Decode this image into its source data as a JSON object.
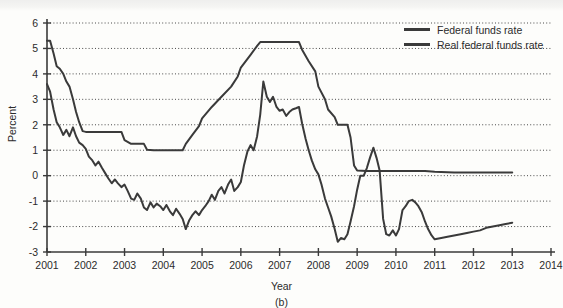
{
  "figure": {
    "panel_label": "(b)",
    "xlabel": "Year",
    "ylabel": "Percent"
  },
  "legend": {
    "position": "top-right",
    "items": [
      {
        "label": "Federal funds rate",
        "color": "#3a3a3a"
      },
      {
        "label": "Real federal funds rate",
        "color": "#3a3a3a"
      }
    ]
  },
  "chart_data": {
    "type": "line",
    "title": "",
    "subtitle": "",
    "panel": "(b)",
    "xlabel": "Year",
    "ylabel": "Percent",
    "xlim": [
      2001,
      2014
    ],
    "ylim": [
      -3,
      6
    ],
    "xticks": [
      2001,
      2002,
      2003,
      2004,
      2005,
      2006,
      2007,
      2008,
      2009,
      2010,
      2011,
      2012,
      2013,
      2014
    ],
    "yticks": [
      -3,
      -2,
      -1,
      0,
      1,
      2,
      3,
      4,
      5,
      6
    ],
    "xtick_labels": [
      "2001",
      "2002",
      "2003",
      "2004",
      "2005",
      "2006",
      "2007",
      "2008",
      "2009",
      "2010",
      "2011",
      "2012",
      "2013",
      "2014"
    ],
    "ytick_labels": [
      "-3",
      "-2",
      "-1",
      "0",
      "1",
      "2",
      "3",
      "4",
      "5",
      "6"
    ],
    "grid": "horizontal-dotted",
    "legend_position": "top-right",
    "series": [
      {
        "name": "Federal funds rate",
        "color": "#3a3a3a",
        "x": [
          2001.0,
          2001.08,
          2001.17,
          2001.25,
          2001.33,
          2001.42,
          2001.5,
          2001.58,
          2001.67,
          2001.75,
          2001.83,
          2001.92,
          2002.0,
          2002.25,
          2002.5,
          2002.75,
          2002.92,
          2003.0,
          2003.17,
          2003.5,
          2003.58,
          2003.75,
          2004.0,
          2004.25,
          2004.5,
          2004.58,
          2004.75,
          2004.92,
          2005.0,
          2005.25,
          2005.5,
          2005.75,
          2005.92,
          2006.0,
          2006.25,
          2006.42,
          2006.5,
          2006.75,
          2007.0,
          2007.25,
          2007.5,
          2007.58,
          2007.75,
          2007.92,
          2008.0,
          2008.17,
          2008.25,
          2008.42,
          2008.5,
          2008.75,
          2008.83,
          2008.92,
          2009.0,
          2009.25,
          2009.5,
          2009.75,
          2010.0,
          2010.25,
          2010.5,
          2010.75,
          2011.0,
          2011.5,
          2012.0,
          2012.5,
          2013.0
        ],
        "y": [
          5.3,
          5.3,
          4.8,
          4.3,
          4.2,
          4.0,
          3.7,
          3.5,
          3.0,
          2.5,
          2.1,
          1.75,
          1.72,
          1.72,
          1.72,
          1.72,
          1.72,
          1.4,
          1.25,
          1.25,
          1.02,
          1.0,
          1.0,
          1.0,
          1.0,
          1.25,
          1.6,
          1.95,
          2.25,
          2.7,
          3.1,
          3.5,
          3.9,
          4.25,
          4.75,
          5.1,
          5.25,
          5.25,
          5.25,
          5.25,
          5.25,
          4.95,
          4.5,
          4.1,
          3.5,
          3.0,
          2.6,
          2.3,
          2.0,
          2.0,
          1.5,
          0.4,
          0.2,
          0.18,
          0.18,
          0.18,
          0.18,
          0.18,
          0.18,
          0.18,
          0.15,
          0.12,
          0.12,
          0.12,
          0.12
        ],
        "notes": "Peaks at 5.25 from mid-2006 through 2007; falls to near zero by early 2009 and stays flat."
      },
      {
        "name": "Real federal funds rate",
        "color": "#3a3a3a",
        "x": [
          2001.0,
          2001.08,
          2001.17,
          2001.25,
          2001.33,
          2001.42,
          2001.5,
          2001.58,
          2001.67,
          2001.75,
          2001.83,
          2001.92,
          2002.0,
          2002.08,
          2002.17,
          2002.25,
          2002.33,
          2002.42,
          2002.5,
          2002.58,
          2002.67,
          2002.75,
          2002.83,
          2002.92,
          2003.0,
          2003.08,
          2003.17,
          2003.25,
          2003.33,
          2003.42,
          2003.5,
          2003.58,
          2003.67,
          2003.75,
          2003.83,
          2003.92,
          2004.0,
          2004.08,
          2004.17,
          2004.25,
          2004.33,
          2004.42,
          2004.5,
          2004.58,
          2004.67,
          2004.75,
          2004.83,
          2004.92,
          2005.0,
          2005.08,
          2005.17,
          2005.25,
          2005.33,
          2005.42,
          2005.5,
          2005.58,
          2005.67,
          2005.75,
          2005.83,
          2005.92,
          2006.0,
          2006.08,
          2006.17,
          2006.25,
          2006.33,
          2006.42,
          2006.5,
          2006.58,
          2006.67,
          2006.75,
          2006.83,
          2006.92,
          2007.0,
          2007.08,
          2007.17,
          2007.25,
          2007.33,
          2007.42,
          2007.5,
          2007.58,
          2007.67,
          2007.75,
          2007.83,
          2007.92,
          2008.0,
          2008.08,
          2008.17,
          2008.25,
          2008.33,
          2008.42,
          2008.5,
          2008.58,
          2008.67,
          2008.75,
          2008.83,
          2008.92,
          2009.0,
          2009.08,
          2009.17,
          2009.25,
          2009.33,
          2009.42,
          2009.5,
          2009.58,
          2009.67,
          2009.75,
          2009.83,
          2009.92,
          2010.0,
          2010.08,
          2010.17,
          2010.25,
          2010.33,
          2010.42,
          2010.5,
          2010.58,
          2010.67,
          2010.75,
          2010.83,
          2010.92,
          2011.0,
          2011.17,
          2011.33,
          2011.5,
          2011.67,
          2011.83,
          2012.0,
          2012.17,
          2012.33,
          2012.5,
          2012.67,
          2012.83,
          2013.0
        ],
        "y": [
          3.6,
          3.3,
          2.6,
          2.1,
          1.9,
          1.6,
          1.8,
          1.55,
          1.9,
          1.55,
          1.3,
          1.2,
          1.05,
          0.75,
          0.6,
          0.4,
          0.55,
          0.3,
          0.1,
          -0.1,
          -0.3,
          -0.15,
          -0.3,
          -0.45,
          -0.35,
          -0.6,
          -0.9,
          -0.95,
          -0.7,
          -0.9,
          -1.25,
          -1.35,
          -1.05,
          -1.25,
          -1.1,
          -1.2,
          -1.35,
          -1.15,
          -1.4,
          -1.55,
          -1.3,
          -1.5,
          -1.7,
          -2.1,
          -1.75,
          -1.55,
          -1.4,
          -1.55,
          -1.35,
          -1.2,
          -1.0,
          -0.75,
          -0.95,
          -0.6,
          -0.45,
          -0.7,
          -0.35,
          -0.15,
          -0.6,
          -0.45,
          -0.25,
          0.4,
          0.95,
          1.2,
          1.0,
          1.55,
          2.4,
          3.7,
          3.1,
          2.9,
          3.1,
          2.7,
          2.55,
          2.6,
          2.35,
          2.5,
          2.6,
          2.65,
          2.7,
          2.05,
          1.45,
          1.0,
          0.6,
          0.25,
          0.05,
          -0.35,
          -0.9,
          -1.25,
          -1.6,
          -2.1,
          -2.6,
          -2.45,
          -2.5,
          -2.3,
          -1.8,
          -1.2,
          -0.55,
          0.0,
          0.0,
          0.3,
          0.7,
          1.1,
          0.7,
          0.2,
          -1.7,
          -2.3,
          -2.35,
          -2.15,
          -2.35,
          -2.1,
          -1.35,
          -1.2,
          -1.0,
          -0.95,
          -1.05,
          -1.2,
          -1.45,
          -1.8,
          -2.1,
          -2.35,
          -2.5,
          -2.45,
          -2.4,
          -2.35,
          -2.3,
          -2.25,
          -2.2,
          -2.15,
          -2.05,
          -2.0,
          -1.95,
          -1.9,
          -1.85
        ],
        "notes": "Starts near 3.6 in 2001, falls below zero through 2002-2005, peaks ~3.7 mid-2006, troughs ~-2.6 mid-2008, spikes ~1.1 early 2009, plunges to ~-2.35, ends ~-1.85 in 2013."
      }
    ]
  }
}
